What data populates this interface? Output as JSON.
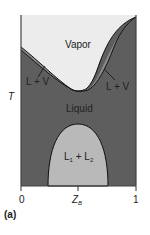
{
  "figure": {
    "panel_label": "(a)",
    "y_axis_label": "T",
    "x_axis_label": "Z",
    "x_axis_subscript": "B",
    "x_ticks": [
      "0",
      "1"
    ],
    "regions": {
      "vapor": "Vapor",
      "liquid": "Liquid",
      "lv_left": "L + V",
      "lv_right": "L + V",
      "l1": "L",
      "l1_sub": "1",
      "plus": " + ",
      "l2": "L",
      "l2_sub": "2"
    },
    "colors": {
      "vapor": "#ececec",
      "two_phase": "#8c8c8c",
      "liquid": "#5e5e5e",
      "miscibility_gap": "#b9b9b9",
      "line": "#111111"
    }
  }
}
